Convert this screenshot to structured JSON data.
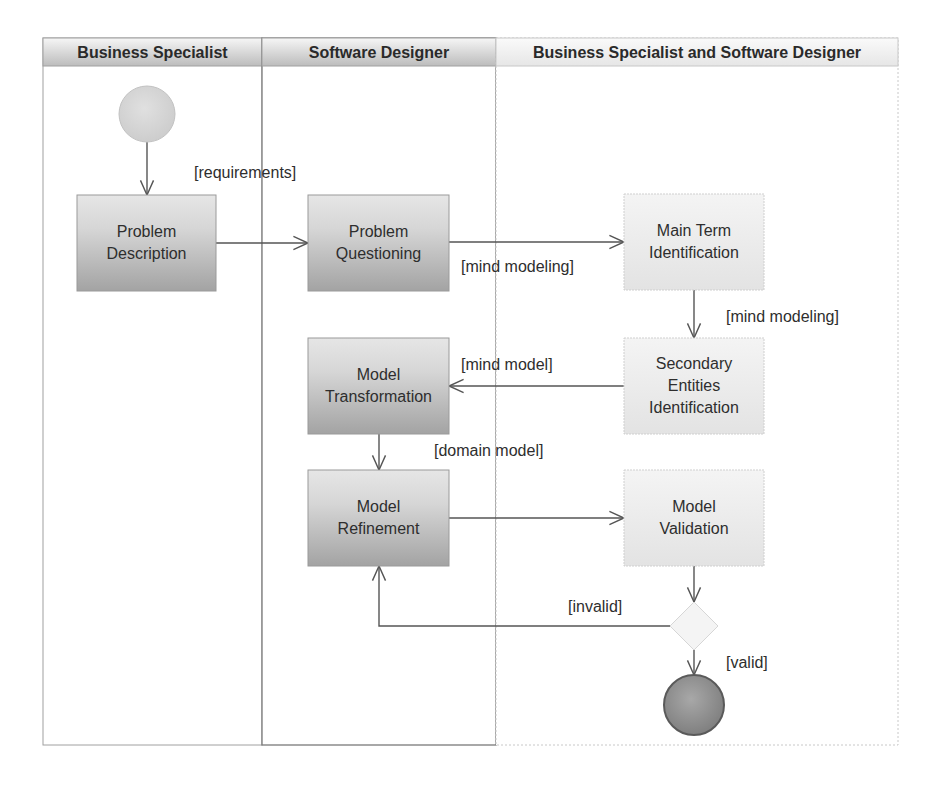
{
  "diagram": {
    "type": "uml-activity-diagram-with-swimlanes",
    "frame": {
      "x": 43,
      "y": 38,
      "width": 855,
      "height": 707,
      "header_height": 28
    },
    "lanes": [
      {
        "id": "lane-business-specialist",
        "label": "Business Specialist",
        "x": 43,
        "width": 219
      },
      {
        "id": "lane-software-designer",
        "label": "Software Designer",
        "x": 262,
        "width": 234
      },
      {
        "id": "lane-both",
        "label": "Business Specialist and Software Designer",
        "x": 496,
        "width": 402
      }
    ],
    "colors": {
      "header_top": "#f4f4f4",
      "header_bottom": "#bdbdbd",
      "dark_box_top": "#e6e6e6",
      "dark_box_bottom": "#a5a5a5",
      "light_box_top": "#f2f2f2",
      "light_box_bottom": "#e4e4e4",
      "start_fill": "#d6d6d6",
      "end_fill": "#8f8f8f",
      "end_stroke": "#5a5a5a",
      "line": "#555555",
      "lane_border": "#9a9a9a"
    },
    "nodes": [
      {
        "id": "start",
        "kind": "initial",
        "cx": 147,
        "cy": 114,
        "r": 28
      },
      {
        "id": "problem-description",
        "kind": "action",
        "style": "dark",
        "x": 77,
        "y": 195,
        "w": 139,
        "h": 96,
        "lines": [
          "Problem",
          "Description"
        ]
      },
      {
        "id": "problem-questioning",
        "kind": "action",
        "style": "dark",
        "x": 308,
        "y": 195,
        "w": 141,
        "h": 96,
        "lines": [
          "Problem",
          "Questioning"
        ]
      },
      {
        "id": "main-term-identification",
        "kind": "action",
        "style": "light",
        "x": 624,
        "y": 194,
        "w": 140,
        "h": 96,
        "lines": [
          "Main Term",
          "Identification"
        ]
      },
      {
        "id": "secondary-entities-identification",
        "kind": "action",
        "style": "light",
        "x": 624,
        "y": 338,
        "w": 140,
        "h": 96,
        "lines": [
          "Secondary",
          "Entities",
          "Identification"
        ]
      },
      {
        "id": "model-transformation",
        "kind": "action",
        "style": "dark",
        "x": 308,
        "y": 338,
        "w": 141,
        "h": 96,
        "lines": [
          "Model",
          "Transformation"
        ]
      },
      {
        "id": "model-refinement",
        "kind": "action",
        "style": "dark",
        "x": 308,
        "y": 470,
        "w": 141,
        "h": 96,
        "lines": [
          "Model",
          "Refinement"
        ]
      },
      {
        "id": "model-validation",
        "kind": "action",
        "style": "light",
        "x": 624,
        "y": 470,
        "w": 140,
        "h": 96,
        "lines": [
          "Model",
          "Validation"
        ]
      },
      {
        "id": "decision",
        "kind": "decision",
        "cx": 694,
        "cy": 626,
        "half": 24
      },
      {
        "id": "end",
        "kind": "final",
        "cx": 694,
        "cy": 705,
        "r": 30
      }
    ],
    "edges": [
      {
        "id": "start-to-problem-description",
        "points": [
          [
            147,
            142
          ],
          [
            147,
            195
          ]
        ],
        "guard": null
      },
      {
        "id": "problem-description-to-problem-questioning",
        "points": [
          [
            216,
            243
          ],
          [
            308,
            243
          ]
        ],
        "guard": {
          "text": "[requirements]",
          "x": 194,
          "y": 178
        }
      },
      {
        "id": "problem-questioning-to-main-term",
        "points": [
          [
            449,
            242
          ],
          [
            624,
            242
          ]
        ],
        "guard": {
          "text": "[mind modeling]",
          "x": 461,
          "y": 272
        }
      },
      {
        "id": "main-term-to-secondary-entities",
        "points": [
          [
            694,
            290
          ],
          [
            694,
            338
          ]
        ],
        "guard": {
          "text": "[mind modeling]",
          "x": 726,
          "y": 322
        }
      },
      {
        "id": "secondary-entities-to-model-transformation",
        "points": [
          [
            624,
            386
          ],
          [
            449,
            386
          ]
        ],
        "guard": {
          "text": "[mind model]",
          "x": 461,
          "y": 370
        }
      },
      {
        "id": "model-transformation-to-model-refinement",
        "points": [
          [
            379,
            434
          ],
          [
            379,
            470
          ]
        ],
        "guard": {
          "text": "[domain model]",
          "x": 434,
          "y": 456
        }
      },
      {
        "id": "model-refinement-to-model-validation",
        "points": [
          [
            449,
            518
          ],
          [
            624,
            518
          ]
        ],
        "guard": null
      },
      {
        "id": "model-validation-to-decision",
        "points": [
          [
            694,
            566
          ],
          [
            694,
            602
          ]
        ],
        "guard": null
      },
      {
        "id": "decision-to-model-refinement",
        "points": [
          [
            670,
            626
          ],
          [
            379,
            626
          ],
          [
            379,
            566
          ]
        ],
        "guard": {
          "text": "[invalid]",
          "x": 568,
          "y": 612
        }
      },
      {
        "id": "decision-to-end",
        "points": [
          [
            694,
            650
          ],
          [
            694,
            675
          ]
        ],
        "guard": {
          "text": "[valid]",
          "x": 726,
          "y": 668
        }
      }
    ]
  }
}
